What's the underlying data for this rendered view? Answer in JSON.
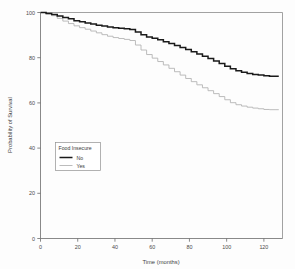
{
  "chart_data": {
    "type": "line",
    "title": "",
    "subtitle": "",
    "xlabel": "Time (months)",
    "ylabel": "Probability of Survival",
    "xlim": [
      0,
      130
    ],
    "ylim": [
      0,
      100
    ],
    "xticks": [
      0,
      20,
      40,
      60,
      80,
      100,
      120
    ],
    "xticklabels": [
      "0",
      "20",
      "40",
      "60",
      "80",
      "100",
      "120"
    ],
    "yticks": [
      0,
      20,
      40,
      60,
      80,
      100
    ],
    "yticklabels": [
      "0",
      "20",
      "40",
      "60",
      "80",
      "100"
    ],
    "grid": false,
    "legend_position": "lower-left-inside",
    "legend_title": "Food Insecure",
    "curve_style": "kaplan-meier-step",
    "series": [
      {
        "name": "No",
        "color": "#1a1a1a",
        "linestyle": "solid",
        "linewidth": 1.5,
        "x": [
          0,
          3,
          6,
          9,
          12,
          15,
          18,
          21,
          24,
          27,
          30,
          33,
          36,
          39,
          42,
          45,
          48,
          51,
          54,
          57,
          60,
          63,
          66,
          69,
          72,
          75,
          78,
          81,
          84,
          87,
          90,
          93,
          96,
          99,
          102,
          105,
          108,
          111,
          114,
          117,
          120,
          123,
          126,
          128
        ],
        "y": [
          100,
          99.6,
          99.1,
          98.4,
          97.8,
          97.2,
          96.4,
          95.9,
          95.4,
          94.9,
          94.4,
          94.0,
          93.6,
          93.2,
          93.0,
          92.8,
          92.5,
          91.4,
          90.2,
          89.2,
          88.6,
          87.9,
          87.1,
          86.3,
          85.4,
          84.5,
          83.6,
          82.6,
          81.6,
          80.6,
          79.6,
          78.5,
          77.4,
          76.2,
          75.1,
          74.2,
          73.6,
          73.0,
          72.6,
          72.3,
          72.0,
          71.8,
          71.8,
          71.8
        ]
      },
      {
        "name": "Yes",
        "color": "#b4b4b4",
        "linestyle": "solid",
        "linewidth": 0.9,
        "x": [
          0,
          3,
          6,
          9,
          12,
          15,
          18,
          21,
          24,
          27,
          30,
          33,
          36,
          39,
          42,
          45,
          48,
          51,
          54,
          57,
          60,
          63,
          66,
          69,
          72,
          75,
          78,
          81,
          84,
          87,
          90,
          93,
          96,
          99,
          102,
          105,
          108,
          111,
          114,
          117,
          120,
          123,
          126,
          128
        ],
        "y": [
          100,
          99.4,
          98.6,
          97.4,
          96.2,
          95.1,
          94.1,
          93.3,
          92.6,
          91.8,
          91.0,
          90.2,
          89.5,
          88.9,
          88.5,
          88.1,
          87.6,
          85.6,
          83.4,
          81.4,
          79.8,
          78.3,
          76.8,
          75.3,
          73.8,
          72.3,
          70.8,
          69.4,
          68.0,
          66.7,
          65.4,
          64.1,
          62.8,
          61.4,
          60.1,
          59.2,
          58.6,
          58.1,
          57.7,
          57.4,
          57.1,
          57.0,
          57.0,
          57.0
        ]
      }
    ]
  },
  "legend": {
    "title": "Food Insecure",
    "entries": [
      {
        "label": "No"
      },
      {
        "label": "Yes"
      }
    ]
  },
  "axes": {
    "x_title": "Time (months)",
    "y_title": "Probability of Survival"
  }
}
